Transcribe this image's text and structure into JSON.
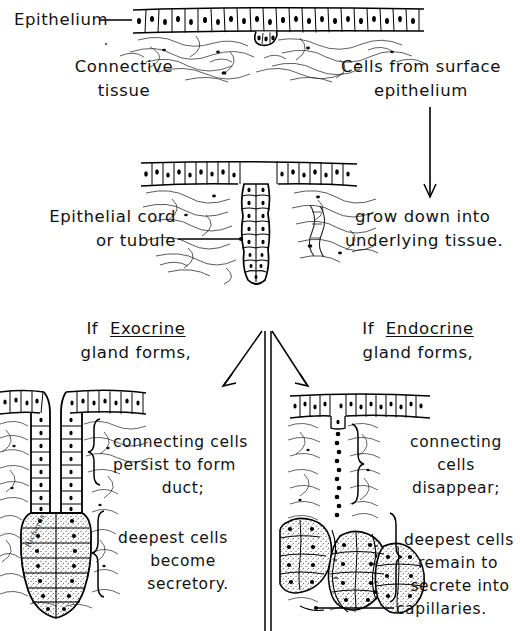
{
  "figure": {
    "type": "histology-diagram",
    "background_color": "#ffffff",
    "ink_color": "#000000"
  },
  "panel_top": {
    "label_epithelium": "Epithelium",
    "label_connective_line1": "Connective",
    "label_connective_line2": "tissue",
    "label_cells_line1": "Cells from surface",
    "label_cells_line2": "epithelium"
  },
  "panel_middle": {
    "label_cord_line1": "Epithelial cord",
    "label_cord_line2": "or tubule",
    "label_grow_line1": "grow down into",
    "label_grow_line2": "underlying tissue."
  },
  "panel_left": {
    "heading_prefix": "If",
    "heading_keyword": "Exocrine",
    "heading_line2": "gland forms,",
    "note_a_line1": "connecting cells",
    "note_a_line2": "persist to form",
    "note_a_line3": "duct;",
    "note_b_line1": "deepest cells",
    "note_b_line2": "become",
    "note_b_line3": "secretory.",
    "signature": "Richards"
  },
  "panel_right": {
    "heading_prefix": "If",
    "heading_keyword": "Endocrine",
    "heading_line2": "gland forms,",
    "note_a_line1": "connecting",
    "note_a_line2": "cells",
    "note_a_line3": "disappear;",
    "note_b_line1": "deepest cells",
    "note_b_line2": "remain to",
    "note_b_line3": "secrete into",
    "note_b_line4": "capillaries."
  },
  "connectors": {
    "epithelium_leader": "leader-line-horizontal",
    "cells_arrow": "arrow-down",
    "tubule_leader": "leader-line-with-dot",
    "branch_arrow_left": "arrow-down-left",
    "branch_arrow_right": "arrow-down-right",
    "divider": "double-vertical-rule",
    "capillary_leader": "leader-line-with-dot"
  }
}
